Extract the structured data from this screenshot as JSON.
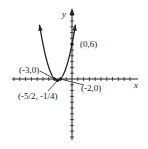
{
  "chart_data": {
    "type": "line",
    "title": "",
    "function": "y = x^2 + 5x + 6",
    "xlabel": "x",
    "ylabel": "y",
    "xlim": [
      -10,
      11
    ],
    "ylim": [
      -10,
      11.5
    ],
    "grid": false,
    "legend": null,
    "series": [
      {
        "name": "parabola",
        "x": [
          -5.6,
          -5,
          -4.5,
          -4,
          -3.5,
          -3,
          -2.75,
          -2.5,
          -2.25,
          -2,
          -1.5,
          -1,
          -0.5,
          0,
          0.5,
          0.6
        ],
        "y": [
          9.36,
          6,
          3.75,
          2,
          0.75,
          0,
          -0.1875,
          -0.25,
          -0.1875,
          0,
          0.75,
          2,
          3.75,
          6,
          8.75,
          9.36
        ]
      }
    ],
    "points": [
      {
        "label": "(0,6)",
        "x": 0,
        "y": 6
      },
      {
        "label": "(-3,0)",
        "x": -3,
        "y": 0
      },
      {
        "label": "(-2,0)",
        "x": -2,
        "y": 0
      },
      {
        "label": "(-5/2, -1/4)",
        "x": -2.5,
        "y": -0.25
      }
    ],
    "annotations": [
      "(0,6)",
      "(-3,0)",
      "(-2,0)",
      "(-5/2, -1/4)"
    ]
  },
  "labels": {
    "x_axis": "x",
    "y_axis": "y",
    "p_0_6": "(0,6)",
    "p_m3_0": "(-3,0)",
    "p_m2_0": "(-2,0)",
    "p_vertex": "(-5/2, -1/4)"
  },
  "colors": {
    "ink": "#222222",
    "background": "#ffffff"
  }
}
